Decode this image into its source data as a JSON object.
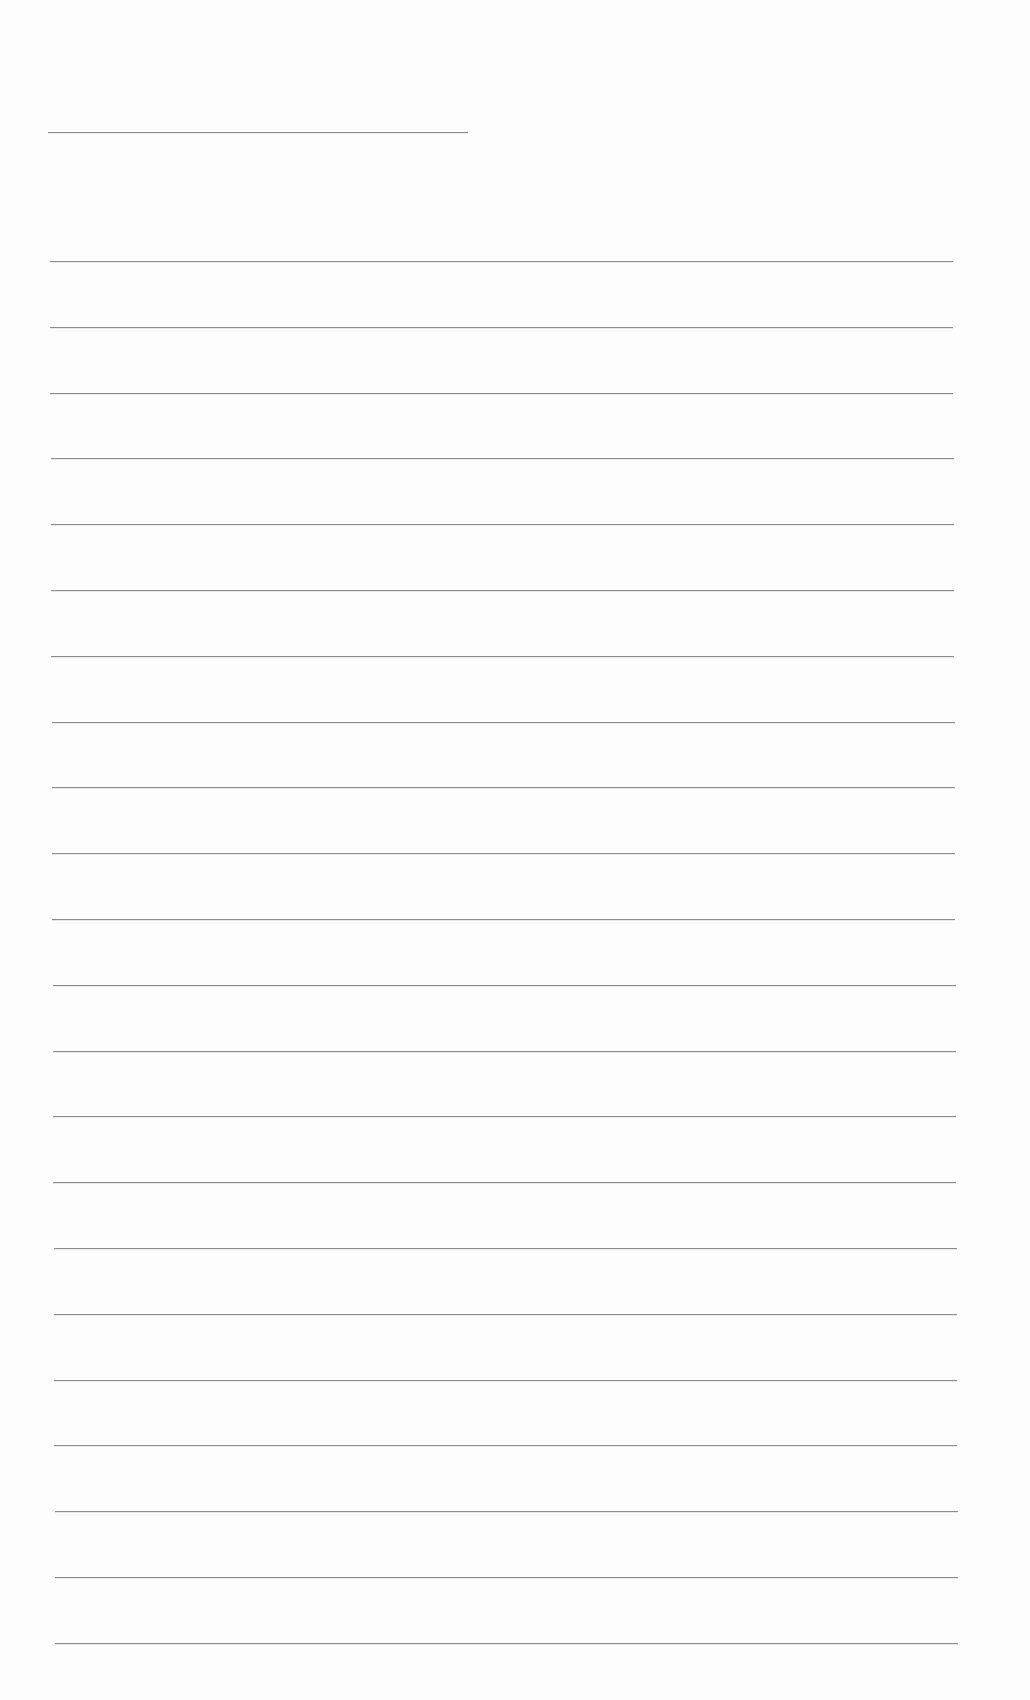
{
  "document": {
    "type": "blank lined sheet",
    "header_line": {
      "top": 132,
      "left": 48,
      "width": 420
    },
    "rules": {
      "count": 22,
      "first_top": 261,
      "spacing": 65.8,
      "left_start": 50,
      "left_end": 55,
      "right_start": 953,
      "right_end": 958
    },
    "colors": {
      "paper": "#fdfdfd",
      "line": "#8c8c8c"
    }
  }
}
